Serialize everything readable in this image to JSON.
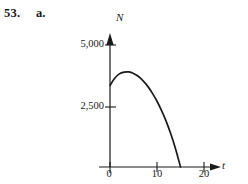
{
  "figure": {
    "exercise_number": "53.",
    "part_letter": "a."
  },
  "chart_data": {
    "type": "line",
    "title": "",
    "xlabel": "t",
    "ylabel": "N",
    "xlim": [
      -2,
      22
    ],
    "ylim": [
      0,
      5600
    ],
    "grid": false,
    "legend": null,
    "x_ticks": [
      {
        "value": 0,
        "label": "0"
      },
      {
        "value": 10,
        "label": "10"
      },
      {
        "value": 20,
        "label": "20"
      }
    ],
    "y_ticks": [
      {
        "value": 2500,
        "label": "2,500"
      },
      {
        "value": 5000,
        "label": "5,000"
      }
    ],
    "axis_arrow_x": true,
    "axis_arrow_y": true,
    "series": [
      {
        "name": "N(t)",
        "x": [
          0,
          1,
          2,
          3,
          4,
          5,
          6,
          7,
          8,
          9,
          10,
          11,
          12,
          13,
          14,
          15
        ],
        "y": [
          3400,
          3700,
          3880,
          3950,
          3960,
          3900,
          3780,
          3600,
          3370,
          3080,
          2740,
          2340,
          1880,
          1340,
          720,
          0
        ]
      }
    ],
    "curve_color": "#1a1a1a",
    "axis_color": "#1a1a1a"
  }
}
